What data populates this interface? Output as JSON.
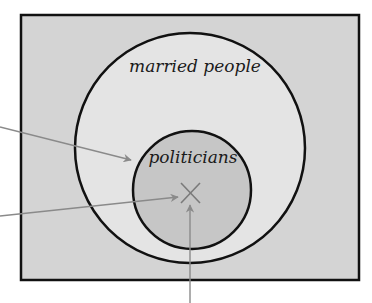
{
  "diagram": {
    "type": "venn",
    "labels": {
      "outer_set": "married people",
      "inner_set": "politicians"
    },
    "marker": "×",
    "colors": {
      "universe_fill": "#d4d4d4",
      "outer_fill": "#e4e4e4",
      "inner_fill": "#c6c6c6",
      "stroke": "#111111",
      "arrow": "#8a8a8a",
      "marker": "#7a7a7a"
    },
    "arrows": [
      {
        "name": "arrow-to-politicians-boundary",
        "from": [
          0,
          127
        ],
        "to": [
          131,
          160
        ]
      },
      {
        "name": "arrow-to-x-marker-left",
        "from": [
          0,
          216
        ],
        "to": [
          180,
          197
        ]
      },
      {
        "name": "arrow-to-x-marker-bottom",
        "from": [
          190,
          303
        ],
        "to": [
          190,
          204
        ]
      }
    ]
  }
}
